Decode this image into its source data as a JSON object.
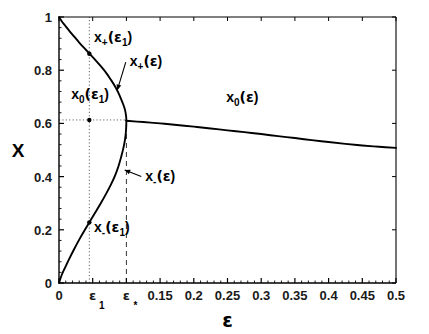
{
  "chart_data": {
    "type": "line",
    "title": "",
    "xlabel": "ε",
    "ylabel": "X",
    "xlim": [
      0,
      0.5
    ],
    "ylim": [
      0,
      1
    ],
    "grid": false,
    "legend": "none",
    "xticks": [
      0,
      0.05,
      0.1,
      0.15,
      0.2,
      0.25,
      0.3,
      0.35,
      0.4,
      0.45,
      0.5
    ],
    "xticklabels": [
      "0",
      "ε",
      "ε",
      "0.15",
      "0.2",
      "0.25",
      "0.3",
      "0.35",
      "0.4",
      "0.45",
      "0.5"
    ],
    "xticklabel_subs": [
      "",
      "1",
      "*",
      "",
      "",
      "",
      "",
      "",
      "",
      "",
      ""
    ],
    "yticks": [
      0,
      0.2,
      0.4,
      0.6,
      0.8,
      1
    ],
    "yticklabels": [
      "0",
      "0.2",
      "0.4",
      "0.6",
      "0.8",
      "1"
    ],
    "series": [
      {
        "name": "x_+(ε)",
        "style": "solid",
        "comment": "upper branch, from (0,1) falling to merge point at (0.1, 0.61)",
        "x": [
          0.0,
          0.004,
          0.009,
          0.015,
          0.022,
          0.03,
          0.038,
          0.046,
          0.054,
          0.062,
          0.07,
          0.077,
          0.083,
          0.088,
          0.092,
          0.0955,
          0.098,
          0.0995,
          0.1
        ],
        "y": [
          1.0,
          0.984,
          0.968,
          0.949,
          0.928,
          0.904,
          0.882,
          0.86,
          0.838,
          0.815,
          0.79,
          0.764,
          0.74,
          0.716,
          0.692,
          0.67,
          0.65,
          0.628,
          0.61
        ]
      },
      {
        "name": "x_-(ε)",
        "style": "solid",
        "comment": "lower branch, from (0,0) rising to merge point at (0.1, 0.61)",
        "x": [
          0.0,
          0.004,
          0.009,
          0.015,
          0.022,
          0.03,
          0.038,
          0.046,
          0.054,
          0.062,
          0.07,
          0.077,
          0.083,
          0.088,
          0.092,
          0.0955,
          0.098,
          0.0995,
          0.1
        ],
        "y": [
          0.0,
          0.03,
          0.058,
          0.09,
          0.125,
          0.163,
          0.198,
          0.232,
          0.266,
          0.3,
          0.336,
          0.37,
          0.403,
          0.437,
          0.472,
          0.507,
          0.54,
          0.576,
          0.61
        ]
      },
      {
        "name": "x_0(ε)",
        "style": "solid",
        "comment": "slowly decaying branch from merge point out to ε=0.5",
        "x": [
          0.1,
          0.125,
          0.15,
          0.175,
          0.2,
          0.225,
          0.25,
          0.275,
          0.3,
          0.325,
          0.35,
          0.375,
          0.4,
          0.425,
          0.45,
          0.475,
          0.5
        ],
        "y": [
          0.61,
          0.605,
          0.6,
          0.594,
          0.588,
          0.581,
          0.574,
          0.567,
          0.56,
          0.552,
          0.545,
          0.537,
          0.53,
          0.523,
          0.517,
          0.512,
          0.508
        ]
      }
    ],
    "guides": [
      {
        "name": "epsilon1-vline",
        "style": "dotted",
        "x": 0.045,
        "y_from": 0,
        "y_to": 1
      },
      {
        "name": "x0-hline",
        "style": "dotted",
        "y": 0.613,
        "x_from": 0,
        "x_to": 0.1
      },
      {
        "name": "epsilon-star-vline",
        "style": "dashed",
        "x": 0.1,
        "y_from": 0,
        "y_to": 0.61
      }
    ],
    "markers": [
      {
        "name": "x-plus-eps1-point",
        "x": 0.045,
        "y": 0.862
      },
      {
        "name": "x0-eps1-point",
        "x": 0.045,
        "y": 0.613
      },
      {
        "name": "x-minus-eps1-point",
        "x": 0.045,
        "y": 0.228
      }
    ],
    "annotations": [
      {
        "name": "x-plus-eps1-label",
        "base": "x",
        "sub": "+",
        "arg": "(ε",
        "argsub": "1",
        "close": ")",
        "x": 0.052,
        "y": 0.905
      },
      {
        "name": "x-plus-eps-label",
        "base": "x",
        "sub": "+",
        "arg": "(ε",
        "argsub": "",
        "close": ")",
        "x": 0.105,
        "y": 0.815,
        "arrow_to_x": 0.0865,
        "arrow_to_y": 0.725
      },
      {
        "name": "x0-eps1-label",
        "base": "x",
        "sub": "0",
        "arg": "(ε",
        "argsub": "1",
        "close": ")",
        "x": 0.018,
        "y": 0.69
      },
      {
        "name": "x0-eps-label",
        "base": "x",
        "sub": "0",
        "arg": "(ε",
        "argsub": "",
        "close": ")",
        "x": 0.248,
        "y": 0.68
      },
      {
        "name": "x-minus-eps-label",
        "base": "x",
        "sub": "-",
        "arg": "(ε",
        "argsub": "",
        "close": ")",
        "x": 0.128,
        "y": 0.385,
        "arrow_to_x": 0.0975,
        "arrow_to_y": 0.425
      },
      {
        "name": "x-minus-eps1-label",
        "base": "x",
        "sub": "-",
        "arg": "(ε",
        "argsub": "1",
        "close": ")",
        "x": 0.052,
        "y": 0.19
      }
    ]
  },
  "axis": {
    "xlabel": "ε",
    "ylabel": "X",
    "xticklabels": [
      "0",
      "ε",
      "ε",
      "0.15",
      "0.2",
      "0.25",
      "0.3",
      "0.35",
      "0.4",
      "0.45",
      "0.5"
    ],
    "xtick_subs": [
      "",
      "1",
      "*",
      "",
      "",
      "",
      "",
      "",
      "",
      "",
      ""
    ],
    "yticklabels": [
      "0",
      "0.2",
      "0.4",
      "0.6",
      "0.8",
      "1"
    ]
  },
  "labels": {
    "x_plus_eps1": {
      "base": "x",
      "sub": "+",
      "mid": "(ε",
      "midsub": "1",
      "end": ")"
    },
    "x_plus_eps": {
      "base": "x",
      "sub": "+",
      "mid": "(ε",
      "midsub": "",
      "end": ")"
    },
    "x0_eps1": {
      "base": "x",
      "sub": "0",
      "mid": "(ε",
      "midsub": "1",
      "end": ")"
    },
    "x0_eps": {
      "base": "x",
      "sub": "0",
      "mid": "(ε",
      "midsub": "",
      "end": ")"
    },
    "x_minus_eps": {
      "base": "x",
      "sub": "-",
      "mid": "(ε",
      "midsub": "",
      "end": ")"
    },
    "x_minus_eps1": {
      "base": "x",
      "sub": "-",
      "mid": "(ε",
      "midsub": "1",
      "end": ")"
    }
  },
  "colors": {
    "curve": "#000000",
    "axis": "#000000",
    "guide": "#555555",
    "background": "#ffffff"
  }
}
